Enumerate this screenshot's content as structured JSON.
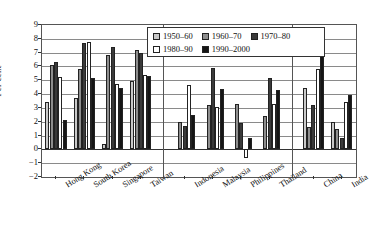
{
  "chart_data": {
    "type": "bar",
    "title": "",
    "xlabel": "",
    "ylabel": "Per cent",
    "ylim": [
      -2,
      9
    ],
    "yticks": [
      -2,
      -1,
      0,
      1,
      2,
      3,
      4,
      5,
      6,
      7,
      8,
      9
    ],
    "grid": true,
    "legend_position": "top-center",
    "categories": [
      "Hong Kong",
      "South Korea",
      "Singapore",
      "Taiwan",
      "Indonesia",
      "Malaysia",
      "Philippines",
      "Thailand",
      "China",
      "India"
    ],
    "group_separators": [
      4,
      8
    ],
    "series": [
      {
        "name": "1950–60",
        "color": "#c9c9c9",
        "values": [
          3.4,
          3.7,
          0.4,
          4.95,
          null,
          null,
          null,
          null,
          4.45,
          2.0
        ]
      },
      {
        "name": "1960–70",
        "color": "#8e8e8e",
        "values": [
          6.1,
          5.85,
          6.8,
          7.2,
          2.0,
          3.2,
          3.3,
          2.4,
          1.6,
          1.5
        ]
      },
      {
        "name": "1970–80",
        "color": "#3a3a3a",
        "values": [
          6.3,
          7.7,
          7.4,
          7.0,
          1.7,
          5.9,
          1.9,
          5.2,
          3.2,
          0.85
        ]
      },
      {
        "name": "1980–90",
        "color": "#ffffff",
        "values": [
          5.25,
          7.8,
          4.75,
          5.4,
          4.65,
          3.1,
          -0.6,
          3.3,
          5.85,
          3.45
        ]
      },
      {
        "name": "1990–2000",
        "color": "#151515",
        "values": [
          2.1,
          5.15,
          4.45,
          5.3,
          2.5,
          4.4,
          0.8,
          4.3,
          6.8,
          3.9
        ]
      }
    ]
  },
  "legend": {
    "entries": [
      {
        "label": "1950–60"
      },
      {
        "label": "1960–70"
      },
      {
        "label": "1970–80"
      },
      {
        "label": "1980–90"
      },
      {
        "label": "1990–2000"
      }
    ]
  },
  "axis": {
    "y_title": "Per cent"
  }
}
